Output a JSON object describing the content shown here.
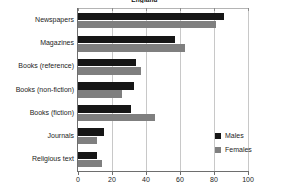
{
  "chart_data": {
    "type": "bar",
    "orientation": "horizontal",
    "title": "England",
    "xlabel": "",
    "ylabel": "",
    "xlim": [
      0,
      100
    ],
    "xticks": [
      0,
      20,
      40,
      60,
      80,
      100
    ],
    "grid": true,
    "legend_position": "right-inside",
    "categories": [
      "Newspapers",
      "Magazines",
      "Books (reference)",
      "Books (non-fiction)",
      "Books (fiction)",
      "Journals",
      "Religious text"
    ],
    "series": [
      {
        "name": "Males",
        "color": "#161616",
        "values": [
          86,
          57,
          34,
          33,
          31,
          15,
          11
        ]
      },
      {
        "name": "Females",
        "color": "#7f7f7f",
        "values": [
          81,
          63,
          37,
          26,
          45,
          11,
          14
        ]
      }
    ]
  },
  "legend": {
    "items": [
      {
        "label": "Males"
      },
      {
        "label": "Females"
      }
    ]
  },
  "axis": {
    "tick_labels": [
      "0",
      "20",
      "40",
      "60",
      "80",
      "100"
    ]
  }
}
